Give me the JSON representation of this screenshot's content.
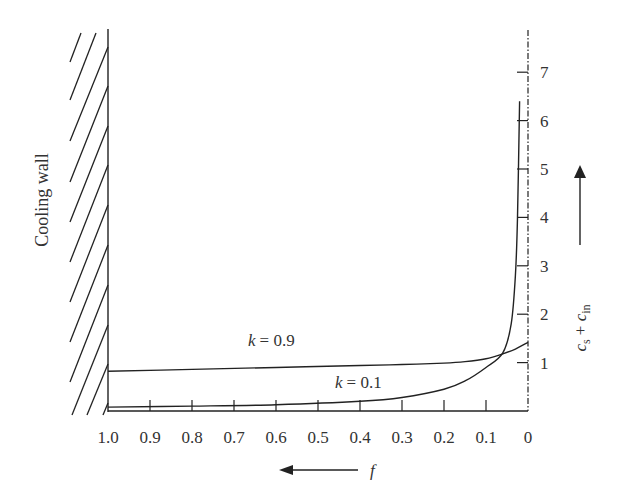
{
  "chart_data": {
    "type": "line",
    "title": "",
    "xlabel": "f",
    "ylabel": "c_s + c_in",
    "x_direction": "decreasing (1.0 on left, 0 on right)",
    "xlim": [
      1.0,
      0
    ],
    "ylim": [
      0,
      7.5
    ],
    "x_ticks": [
      "1.0",
      "0.9",
      "0.8",
      "0.7",
      "0.6",
      "0.5",
      "0.4",
      "0.3",
      "0.2",
      "0.1",
      "0"
    ],
    "y_ticks": [
      "1",
      "2",
      "3",
      "4",
      "5",
      "6",
      "7"
    ],
    "grid": false,
    "left_boundary_label": "Cooling wall",
    "right_axis_style": "dash-dot",
    "series": [
      {
        "name": "k = 0.9",
        "x": [
          1.0,
          0.8,
          0.6,
          0.4,
          0.3,
          0.2,
          0.15,
          0.1,
          0.06,
          0.03,
          0.0
        ],
        "y": [
          0.82,
          0.86,
          0.9,
          0.94,
          0.96,
          0.99,
          1.02,
          1.08,
          1.18,
          1.28,
          1.42
        ]
      },
      {
        "name": "k = 0.1",
        "x": [
          1.0,
          0.8,
          0.6,
          0.4,
          0.3,
          0.2,
          0.15,
          0.1,
          0.06,
          0.04,
          0.03,
          0.025,
          0.02
        ],
        "y": [
          0.08,
          0.1,
          0.13,
          0.2,
          0.28,
          0.45,
          0.62,
          0.9,
          1.2,
          1.8,
          2.8,
          4.0,
          6.4
        ]
      }
    ],
    "annotations": [
      {
        "text": "k = 0.9",
        "near": "upper curve, f≈0.55"
      },
      {
        "text": "k = 0.1",
        "near": "lower curve, f≈0.35"
      }
    ]
  },
  "labels": {
    "wall": "Cooling wall",
    "k_high": "= 0.9",
    "k_low": "= 0.1",
    "k_symbol": "k",
    "x_axis": "f",
    "y_axis_c": "c",
    "y_axis_s": "s",
    "y_axis_plus": " + ",
    "y_axis_in": "in"
  }
}
